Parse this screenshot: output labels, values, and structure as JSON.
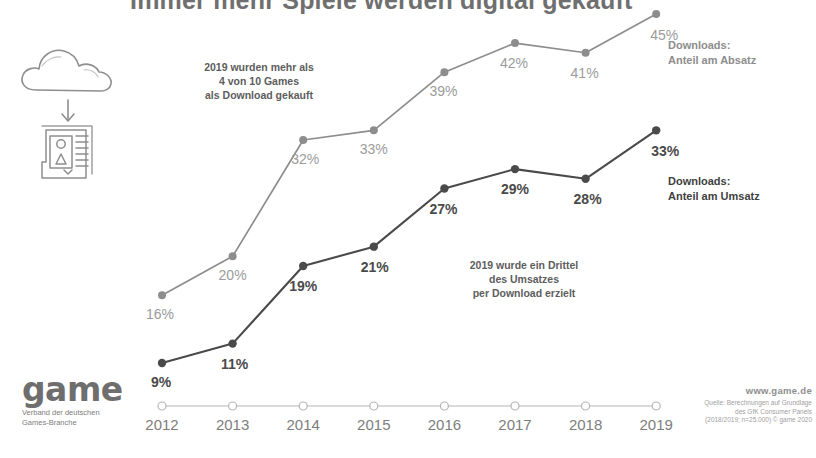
{
  "header": {
    "title": "Immer mehr Spiele werden digital gekauft"
  },
  "annotations": {
    "absatz_note": "2019 wurden mehr als\n4 von 10 Games\nals Download gekauft",
    "umsatz_note": "2019 wurde ein Drittel\ndes Umsatzes\nper Download erzielt"
  },
  "series_labels": {
    "absatz": "Downloads:\nAnteil am Absatz",
    "umsatz": "Downloads:\nAnteil am Umsatz"
  },
  "icons": {
    "cloud": "cloud-icon",
    "arrow": "download-arrow-icon",
    "document": "document-icon"
  },
  "footer": {
    "logo_word": "game",
    "logo_sub": "Verband der deutschen\nGames-Branche",
    "url": "www.game.de",
    "source": "Quelle: Berechnungen auf Grundlage\ndes GfK Consumer Panels\n(2018/2019; n=25.000) © game 2020"
  },
  "colors": {
    "absatz_line": "#8d8d8d",
    "absatz_label": "#9b9b9b",
    "umsatz_line": "#4a4a4a",
    "umsatz_label": "#4a4a4a",
    "axis": "#b5b5b5"
  },
  "chart_data": {
    "type": "line",
    "title": "Immer mehr Spiele werden digital gekauft",
    "xlabel": "",
    "ylabel": "",
    "categories": [
      "2012",
      "2013",
      "2014",
      "2015",
      "2016",
      "2017",
      "2018",
      "2019"
    ],
    "ylim": [
      0,
      50
    ],
    "grid": false,
    "legend_position": "right-inline",
    "value_suffix": "%",
    "series": [
      {
        "name": "Downloads: Anteil am Absatz",
        "color": "#8d8d8d",
        "values": [
          16,
          20,
          32,
          33,
          39,
          42,
          41,
          45
        ],
        "labels": [
          "16%",
          "20%",
          "32%",
          "33%",
          "39%",
          "42%",
          "41%",
          "45%"
        ]
      },
      {
        "name": "Downloads: Anteil am Umsatz",
        "color": "#4a4a4a",
        "values": [
          9,
          11,
          19,
          21,
          27,
          29,
          28,
          33
        ],
        "labels": [
          "9%",
          "11%",
          "19%",
          "21%",
          "27%",
          "29%",
          "28%",
          "33%"
        ]
      }
    ],
    "annotations": [
      "2019 wurden mehr als 4 von 10 Games als Download gekauft",
      "2019 wurde ein Drittel des Umsatzes per Download erzielt"
    ]
  }
}
